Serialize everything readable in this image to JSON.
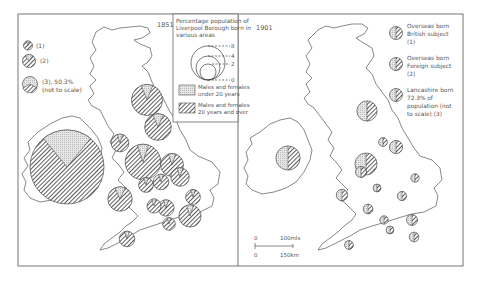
{
  "figure": {
    "panels": [
      {
        "id": "1851",
        "year_label": "1851",
        "legend": {
          "items": [
            {
              "symbol": "pie-small-striped",
              "label": "(1)"
            },
            {
              "symbol": "pie-medium-striped",
              "label": "(2)"
            },
            {
              "symbol": "pie-large-stippled",
              "label": "(3), 50.3%",
              "note": "(not to scale)"
            }
          ]
        }
      },
      {
        "id": "1901",
        "year_label": "1901",
        "legend": {
          "items": [
            {
              "label_lines": [
                "Overseas born",
                "British subject",
                "(1)"
              ]
            },
            {
              "label_lines": [
                "Overseas born",
                "Foreign subject",
                "(2)"
              ]
            },
            {
              "label_lines": [
                "Lancashire born",
                "72.3% of",
                "population (not",
                "to scale) (3)"
              ]
            }
          ]
        },
        "scale_bar": {
          "top_zero": "0",
          "top_label": "100mls",
          "bottom_zero": "0",
          "bottom_label": "150km"
        }
      }
    ],
    "key": {
      "title_lines": [
        "Percentage population of",
        "Liverpool Borough born in",
        "various areas"
      ],
      "circle_scale": [
        "8",
        "4",
        "2",
        "0"
      ],
      "pattern_labels": [
        {
          "pattern": "stipple",
          "lines": [
            "Males and females",
            "under 20 years"
          ]
        },
        {
          "pattern": "hatch",
          "lines": [
            "Males and females",
            "20 years and over"
          ]
        }
      ]
    },
    "pies_1851": [
      {
        "size": 1.0,
        "young_share": 0.22
      },
      {
        "size": 0.42,
        "young_share": 0.12
      },
      {
        "size": 0.33,
        "young_share": 0.14
      },
      {
        "size": 0.14,
        "young_share": 0.1
      },
      {
        "size": 0.24,
        "young_share": 0.1
      },
      {
        "size": 0.36,
        "young_share": 0.13
      },
      {
        "size": 0.31,
        "young_share": 0.1
      },
      {
        "size": 0.48,
        "young_share": 0.1
      },
      {
        "size": 0.25,
        "young_share": 0.1
      },
      {
        "size": 0.2,
        "young_share": 0.1
      },
      {
        "size": 0.21,
        "young_share": 0.1
      },
      {
        "size": 0.22,
        "young_share": 0.1
      },
      {
        "size": 0.19,
        "young_share": 0.1
      },
      {
        "size": 0.3,
        "young_share": 0.1
      },
      {
        "size": 0.17,
        "young_share": 0.1
      },
      {
        "size": 0.21,
        "young_share": 0.1
      },
      {
        "size": 0.2,
        "young_share": 0.1
      }
    ],
    "pies_1901": [
      {
        "size": 0.55,
        "young_share": 0.5
      },
      {
        "size": 0.5,
        "young_share": 0.5
      },
      {
        "size": 0.46,
        "young_share": 0.5
      },
      {
        "size": 0.2,
        "young_share": 0.5
      },
      {
        "size": 0.25,
        "young_share": 0.5
      },
      {
        "size": 0.3,
        "young_share": 0.5
      },
      {
        "size": 0.26,
        "young_share": 0.5
      },
      {
        "size": 0.22,
        "young_share": 0.5
      },
      {
        "size": 0.19,
        "young_share": 0.5
      },
      {
        "size": 0.18,
        "young_share": 0.5
      },
      {
        "size": 0.21,
        "young_share": 0.5
      },
      {
        "size": 0.18,
        "young_share": 0.5
      },
      {
        "size": 0.22,
        "young_share": 0.5
      },
      {
        "size": 0.25,
        "young_share": 0.5
      },
      {
        "size": 0.2,
        "young_share": 0.5
      },
      {
        "size": 0.19,
        "young_share": 0.5
      }
    ]
  }
}
